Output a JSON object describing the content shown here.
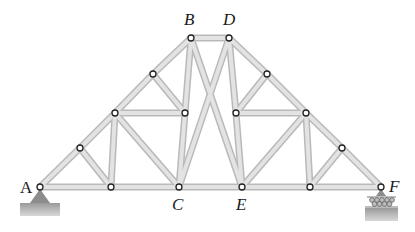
{
  "diagram": {
    "type": "truss",
    "labels": [
      {
        "id": "A",
        "text": "A",
        "x": 20,
        "y": 193,
        "italic": false
      },
      {
        "id": "B",
        "text": "B",
        "x": 184,
        "y": 25,
        "italic": true
      },
      {
        "id": "C",
        "text": "C",
        "x": 172,
        "y": 210,
        "italic": true
      },
      {
        "id": "D",
        "text": "D",
        "x": 223,
        "y": 25,
        "italic": true
      },
      {
        "id": "E",
        "text": "E",
        "x": 236,
        "y": 210,
        "italic": true
      },
      {
        "id": "F",
        "text": "F",
        "x": 389,
        "y": 192,
        "italic": true
      }
    ],
    "nodes": {
      "A": [
        40,
        187
      ],
      "L1": [
        111,
        187
      ],
      "C": [
        179,
        187
      ],
      "E": [
        242,
        187
      ],
      "R1": [
        310,
        187
      ],
      "F": [
        381,
        187
      ],
      "B": [
        191,
        38
      ],
      "D": [
        229,
        38
      ],
      "LT1": [
        80,
        148
      ],
      "LT2": [
        115,
        113
      ],
      "LT3": [
        153,
        74
      ],
      "LI": [
        185,
        113
      ],
      "RT3": [
        267,
        74
      ],
      "RT2": [
        306,
        113
      ],
      "RT1": [
        342,
        148
      ],
      "RI": [
        236,
        113
      ]
    },
    "members": [
      [
        "A",
        "L1"
      ],
      [
        "L1",
        "C"
      ],
      [
        "C",
        "E"
      ],
      [
        "E",
        "R1"
      ],
      [
        "R1",
        "F"
      ],
      [
        "A",
        "LT1"
      ],
      [
        "LT1",
        "LT2"
      ],
      [
        "LT2",
        "LT3"
      ],
      [
        "LT3",
        "B"
      ],
      [
        "B",
        "D"
      ],
      [
        "D",
        "RT3"
      ],
      [
        "RT3",
        "RT2"
      ],
      [
        "RT2",
        "RT1"
      ],
      [
        "RT1",
        "F"
      ],
      [
        "LT1",
        "L1"
      ],
      [
        "LT2",
        "L1"
      ],
      [
        "LT2",
        "C"
      ],
      [
        "LT2",
        "LI"
      ],
      [
        "LT3",
        "LI"
      ],
      [
        "B",
        "LI"
      ],
      [
        "LI",
        "C"
      ],
      [
        "B",
        "E"
      ],
      [
        "D",
        "C"
      ],
      [
        "D",
        "RI"
      ],
      [
        "RI",
        "E"
      ],
      [
        "RT3",
        "RI"
      ],
      [
        "RI",
        "RT2"
      ],
      [
        "RT2",
        "E"
      ],
      [
        "RT2",
        "R1"
      ],
      [
        "RT1",
        "R1"
      ]
    ],
    "supports": {
      "A": {
        "kind": "pin",
        "color": "#8a8a8a",
        "ground_color": "#a6a6a6"
      },
      "F": {
        "kind": "roller",
        "color": "#8a8a8a",
        "ground_color": "#a6a6a6"
      }
    },
    "colors": {
      "member_edge": "#b9b9b9",
      "member_fill": "#e3e3e3",
      "joint_stroke": "#222222",
      "label": "#1a1a1a"
    }
  }
}
